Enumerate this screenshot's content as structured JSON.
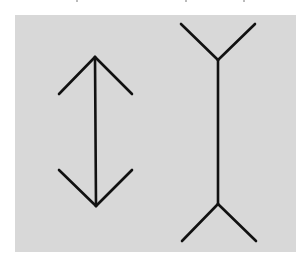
{
  "figure": {
    "name": "Muller-Lyer illusion",
    "background_color": "#d8d8d8",
    "line_color": "#111111",
    "line_width": 2.6,
    "left_figure": {
      "label": "arrowheads-inward",
      "shaft": {
        "x1": 95,
        "y1": 57,
        "x2": 96,
        "y2": 206
      },
      "top_fins": [
        [
          59,
          94,
          95,
          57
        ],
        [
          95,
          57,
          132,
          94
        ]
      ],
      "bottom_fins": [
        [
          59,
          170,
          96,
          206
        ],
        [
          96,
          206,
          132,
          170
        ]
      ]
    },
    "right_figure": {
      "label": "arrowheads-outward",
      "shaft": {
        "x1": 218,
        "y1": 60,
        "x2": 218,
        "y2": 204
      },
      "top_fins": [
        [
          181,
          24,
          218,
          60
        ],
        [
          218,
          60,
          255,
          24
        ]
      ],
      "bottom_fins": [
        [
          182,
          241,
          218,
          204
        ],
        [
          218,
          204,
          256,
          241
        ]
      ]
    }
  }
}
